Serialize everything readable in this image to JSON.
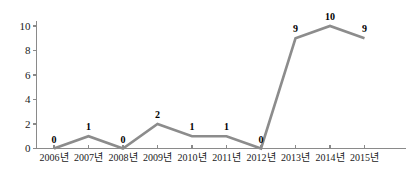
{
  "chart_data": {
    "type": "line",
    "title": "",
    "subtitle": "",
    "xlabel": "",
    "ylabel": "",
    "categories": [
      "2006년",
      "2007년",
      "2008년",
      "2009년",
      "2010년",
      "2011년",
      "2012년",
      "2013년",
      "2014년",
      "2015년"
    ],
    "values": [
      0,
      1,
      0,
      2,
      1,
      1,
      0,
      9,
      10,
      9
    ],
    "point_labels": [
      "0",
      "1",
      "0",
      "2",
      "1",
      "1",
      "0",
      "9",
      "10",
      "9"
    ],
    "ylim": [
      0,
      10
    ],
    "ytick_values": [
      0,
      2,
      4,
      6,
      8,
      10
    ],
    "ytick_labels": [
      "0",
      "2",
      "4",
      "6",
      "8",
      "10"
    ],
    "grid": false,
    "legend": false,
    "legend_position": "none",
    "series": [
      {
        "name": "",
        "values": [
          0,
          1,
          0,
          2,
          1,
          1,
          0,
          9,
          10,
          9
        ],
        "color": "#8c8c8c"
      }
    ],
    "colors": {
      "line": "#8c8c8c",
      "axis": "#8a8a8a",
      "label_text": "#1a1a1a",
      "point_label_text": "#000000",
      "background": "#ffffff"
    }
  }
}
